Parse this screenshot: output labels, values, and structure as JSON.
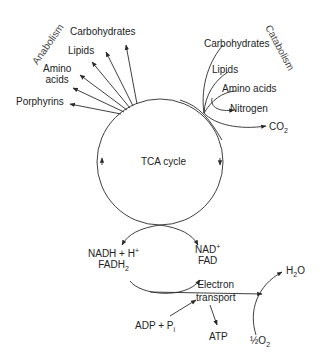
{
  "diagram": {
    "center_label": "TCA cycle",
    "anabolism": {
      "heading": "Anabolism",
      "products": [
        "Carbohydrates",
        "Lipids",
        "Amino acids",
        "Porphyrins"
      ],
      "amino_line1": "Amino",
      "amino_line2": "acids"
    },
    "catabolism": {
      "heading": "Catabolism",
      "inputs": [
        "Carbohydrates",
        "Lipids",
        "Amino acids"
      ],
      "outputs": [
        "Nitrogen",
        "CO2"
      ],
      "co2_base": "CO",
      "co2_sub": "2"
    },
    "redox": {
      "reduced_line1": "NADH + H",
      "reduced_sup": "+",
      "reduced_line2_base": "FADH",
      "reduced_line2_sub": "2",
      "oxidized_line1": "NAD",
      "oxidized_sup": "+",
      "oxidized_line2": "FAD"
    },
    "electron_transport": {
      "line1": "Electron",
      "line2": "transport"
    },
    "phosphorylation": {
      "adp_text": "ADP + P",
      "adp_sub": "i",
      "atp": "ATP"
    },
    "oxygen": {
      "input_prefix": "½O",
      "input_sub": "2",
      "water_base": "H",
      "water_sub": "2",
      "water_suffix": "O"
    },
    "colors": {
      "line": "#2a2a2a",
      "text": "#222222",
      "background": "#ffffff"
    }
  }
}
